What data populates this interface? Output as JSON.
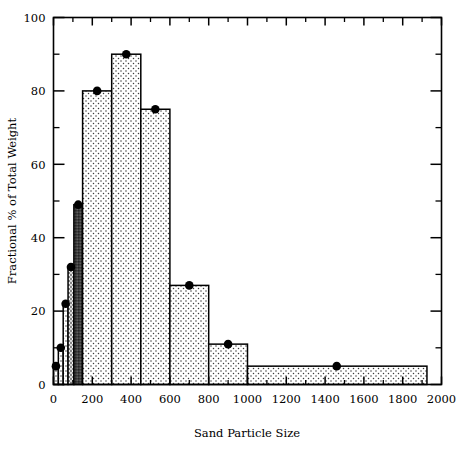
{
  "chart_data": {
    "type": "bar",
    "title": "",
    "xlabel": "Sand Particle Size",
    "ylabel": "Fractional % of Total Weight",
    "xlim": [
      0,
      2000
    ],
    "ylim": [
      0,
      100
    ],
    "xticks": [
      0,
      200,
      400,
      600,
      800,
      1000,
      1200,
      1400,
      1600,
      1800,
      2000
    ],
    "xtick_labels": [
      "0",
      "200",
      "400",
      "600",
      "800",
      "1000",
      "1200",
      "1400",
      "1600",
      "1800",
      "2000"
    ],
    "yticks": [
      0,
      20,
      40,
      60,
      80,
      100
    ],
    "ytick_labels": [
      "0",
      "20",
      "40",
      "60",
      "80",
      "100"
    ],
    "y_minor_ticks": [
      10,
      30,
      50,
      70,
      90
    ],
    "x_minor_ticks": [
      100,
      300,
      500,
      700,
      900,
      1100,
      1300,
      1500,
      1700,
      1900
    ],
    "grid": false,
    "legend": null,
    "marker": "filled-circle",
    "marker_color": "#000000",
    "bar_edge_color": "#000000",
    "bar_fill_pattern": "stipple-dots",
    "bars": [
      {
        "label": "0-25",
        "x_start": 0,
        "x_end": 25,
        "value": 5,
        "shade": "light"
      },
      {
        "label": "25-50",
        "x_start": 25,
        "x_end": 50,
        "value": 10,
        "shade": "light"
      },
      {
        "label": "50-75",
        "x_start": 50,
        "x_end": 75,
        "value": 22,
        "shade": "light"
      },
      {
        "label": "75-105",
        "x_start": 75,
        "x_end": 105,
        "value": 32,
        "shade": "medium"
      },
      {
        "label": "105-150",
        "x_start": 105,
        "x_end": 150,
        "value": 49,
        "shade": "dark"
      },
      {
        "label": "150-300",
        "x_start": 150,
        "x_end": 300,
        "value": 80,
        "shade": "light"
      },
      {
        "label": "300-450",
        "x_start": 300,
        "x_end": 450,
        "value": 90,
        "shade": "light"
      },
      {
        "label": "450-600",
        "x_start": 450,
        "x_end": 600,
        "value": 75,
        "shade": "light"
      },
      {
        "label": "600-800",
        "x_start": 600,
        "x_end": 800,
        "value": 27,
        "shade": "light"
      },
      {
        "label": "800-1000",
        "x_start": 800,
        "x_end": 1000,
        "value": 11,
        "shade": "light"
      },
      {
        "label": "1000-1925",
        "x_start": 1000,
        "x_end": 1925,
        "value": 5,
        "shade": "light"
      }
    ],
    "markers": [
      {
        "x": 12.5,
        "y": 5
      },
      {
        "x": 37.5,
        "y": 10
      },
      {
        "x": 62.5,
        "y": 22
      },
      {
        "x": 90,
        "y": 32
      },
      {
        "x": 127.5,
        "y": 49
      },
      {
        "x": 225,
        "y": 80
      },
      {
        "x": 375,
        "y": 90
      },
      {
        "x": 525,
        "y": 75
      },
      {
        "x": 700,
        "y": 27
      },
      {
        "x": 900,
        "y": 11
      },
      {
        "x": 1460,
        "y": 5
      }
    ]
  },
  "figure": {
    "background_color": "#ffffff",
    "frame_color": "#000000"
  }
}
